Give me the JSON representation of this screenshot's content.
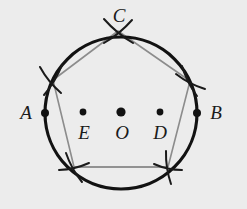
{
  "figure": {
    "background_color": "#ececec",
    "circle_color": "#121212",
    "pentagon_color": "#8c8c8c",
    "arc_color": "#1a1a1a",
    "point_color": "#121212",
    "label_color": "#1a1a1a",
    "circle": {
      "center_x": 121,
      "center_y": 113,
      "radius": 76,
      "stroke_width": 3.2
    },
    "labels": [
      {
        "id": "A",
        "text": "A",
        "x": 26,
        "y": 119,
        "font_size": 19,
        "anchor": "middle"
      },
      {
        "id": "E",
        "text": "E",
        "x": 84,
        "y": 139,
        "font_size": 19,
        "anchor": "middle"
      },
      {
        "id": "O",
        "text": "O",
        "x": 122,
        "y": 139,
        "font_size": 19,
        "anchor": "middle"
      },
      {
        "id": "D",
        "text": "D",
        "x": 160,
        "y": 139,
        "font_size": 19,
        "anchor": "middle"
      },
      {
        "id": "B",
        "text": "B",
        "x": 216,
        "y": 119,
        "font_size": 19,
        "anchor": "middle"
      },
      {
        "id": "C",
        "text": "C",
        "x": 119,
        "y": 22,
        "font_size": 19,
        "anchor": "middle"
      }
    ],
    "points": [
      {
        "id": "A",
        "x": 45,
        "y": 113,
        "r": 4.0
      },
      {
        "id": "E",
        "x": 83,
        "y": 112,
        "r": 3.4
      },
      {
        "id": "O",
        "x": 121,
        "y": 112,
        "r": 4.6
      },
      {
        "id": "D",
        "x": 160,
        "y": 112,
        "r": 3.4
      },
      {
        "id": "B",
        "x": 197,
        "y": 113,
        "r": 4.0
      }
    ],
    "pentagon": {
      "stroke_width": 1.6,
      "vertices": [
        {
          "id": "C",
          "x": 118,
          "y": 31
        },
        {
          "id": "V2",
          "x": 190,
          "y": 81
        },
        {
          "id": "V3",
          "x": 168,
          "y": 167
        },
        {
          "id": "V4",
          "x": 74,
          "y": 167
        },
        {
          "id": "V5",
          "x": 53,
          "y": 80
        }
      ]
    },
    "construction_arcs": [
      {
        "id": "arc-at-C",
        "cx": 118,
        "cy": 31,
        "a1x": 104,
        "a1y": 43,
        "a2x": 132,
        "a2y": 20,
        "b1x": 104,
        "b1y": 19,
        "b2x": 133,
        "b2y": 43
      },
      {
        "id": "arc-at-V2",
        "cx": 190,
        "cy": 81,
        "a1x": 176,
        "a1y": 74,
        "a2x": 205,
        "a2y": 89,
        "b1x": 182,
        "b1y": 66,
        "b2x": 197,
        "b2y": 96
      },
      {
        "id": "arc-at-V3",
        "cx": 168,
        "cy": 167,
        "a1x": 154,
        "a1y": 164,
        "a2x": 182,
        "a2y": 170,
        "b1x": 166,
        "b1y": 151,
        "b2x": 171,
        "b2y": 184
      },
      {
        "id": "arc-at-V4",
        "cx": 74,
        "cy": 167,
        "a1x": 59,
        "a1y": 170,
        "a2x": 89,
        "a2y": 163,
        "b1x": 66,
        "b1y": 153,
        "b2x": 82,
        "b2y": 182
      },
      {
        "id": "arc-at-V5",
        "cx": 53,
        "cy": 80,
        "a1x": 40,
        "a1y": 67,
        "a2x": 61,
        "a2y": 93,
        "b1x": 44,
        "b1y": 95,
        "b2x": 62,
        "b2y": 65
      }
    ],
    "chords": [
      {
        "id": "chord-bottom",
        "x1": 74,
        "y1": 167,
        "x2": 168,
        "y2": 167
      }
    ]
  }
}
